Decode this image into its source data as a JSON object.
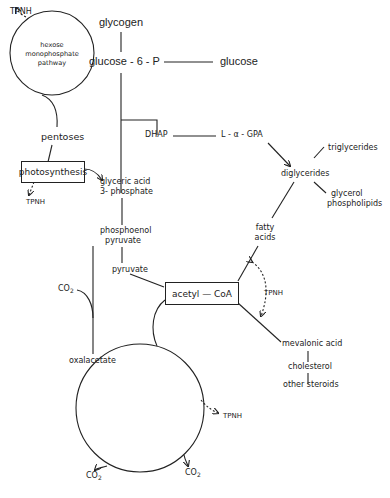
{
  "nodes": {
    "tpnh_top": "TPNH",
    "hmp_line1": "hexose",
    "hmp_line2": "monophosphate",
    "hmp_line3": "pathway",
    "glycogen": "glycogen",
    "glucose6p": "glucose - 6 - P",
    "glucose": "glucose",
    "pentoses": "pentoses",
    "dhap": "DHAP",
    "lagpa": "L - α - GPA",
    "photosynthesis": "photosynthesis",
    "tpnh_photo": "TPNH",
    "glyceric_line1": "glyceric acid",
    "glyceric_line2": "3- phosphate",
    "triglycerides": "triglycerides",
    "diglycerides": "diglycerides",
    "glycerol_line1": "glycerol",
    "glycerol_line2": "phospholipids",
    "pep_line1": "phosphoenol",
    "pep_line2": "pyruvate",
    "fatty_line1": "fatty",
    "fatty_line2": "acids",
    "pyruvate": "pyruvate",
    "co2_left": "CO",
    "co2_sub": "2",
    "acetyl_coa": "acetyl — CoA",
    "tpnh_acetyl": "TPNH",
    "oxalacetate": "oxalacetate",
    "mevalonic": "mevalonic acid",
    "cholesterol": "cholesterol",
    "other_steroids": "other steroids",
    "tpnh_tca": "TPNH",
    "co2_bottom_left": "CO",
    "co2_bottom_right": "CO"
  },
  "colors": {
    "line": "#222222",
    "background": "#ffffff"
  }
}
